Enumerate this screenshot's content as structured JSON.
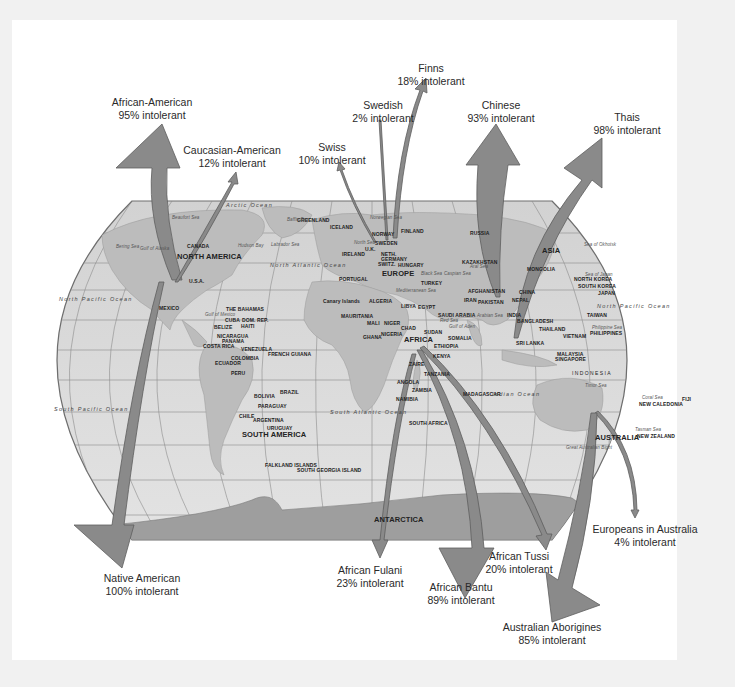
{
  "colors": {
    "background": "#f1f1f1",
    "page": "#ffffff",
    "ocean": "#dcdcdc",
    "land": "#bdbdbd",
    "antarctica": "#9e9e9e",
    "arrow_fill": "#8a8a8a",
    "arrow_stroke": "#5e5e5e",
    "grid": "#8c8c8c"
  },
  "populations": [
    {
      "id": "african-american",
      "name": "African-American",
      "value": "95% intolerant"
    },
    {
      "id": "caucasian-american",
      "name": "Caucasian-American",
      "value": "12% intolerant"
    },
    {
      "id": "swiss",
      "name": "Swiss",
      "value": "10% intolerant"
    },
    {
      "id": "swedish",
      "name": "Swedish",
      "value": "2% intolerant"
    },
    {
      "id": "finns",
      "name": "Finns",
      "value": "18% intolerant"
    },
    {
      "id": "chinese",
      "name": "Chinese",
      "value": "93% intolerant"
    },
    {
      "id": "thais",
      "name": "Thais",
      "value": "98% intolerant"
    },
    {
      "id": "native-american",
      "name": "Native American",
      "value": "100% intolerant"
    },
    {
      "id": "african-fulani",
      "name": "African Fulani",
      "value": "23% intolerant"
    },
    {
      "id": "african-bantu",
      "name": "African Bantu",
      "value": "89% intolerant"
    },
    {
      "id": "african-tussi",
      "name": "African Tussi",
      "value": "20% intolerant"
    },
    {
      "id": "europeans-australia",
      "name": "Europeans in Australia",
      "value": "4% intolerant"
    },
    {
      "id": "australian-aborigines",
      "name": "Australian Aborigines",
      "value": "85% intolerant"
    }
  ],
  "map": {
    "continents": [
      "NORTH AMERICA",
      "SOUTH AMERICA",
      "EUROPE",
      "AFRICA",
      "ASIA",
      "AUSTRALIA",
      "ANTARCTICA"
    ],
    "oceans": [
      "Arctic Ocean",
      "North Pacific Ocean",
      "North Atlantic Ocean",
      "South Pacific Ocean",
      "South Atlantic Ocean",
      "Indian Ocean",
      "North Pacific Ocean"
    ],
    "places": [
      "CANADA",
      "U.S.A.",
      "MEXICO",
      "THE BAHAMAS",
      "CUBA",
      "DOM. REP.",
      "HAITI",
      "BELIZE",
      "NICARAGUA",
      "PANAMA",
      "COSTA RICA",
      "VENEZUELA",
      "COLOMBIA",
      "FRENCH GUIANA",
      "ECUADOR",
      "PERU",
      "BRAZIL",
      "BOLIVIA",
      "PARAGUAY",
      "CHILE",
      "ARGENTINA",
      "URUGUAY",
      "FALKLAND ISLANDS",
      "SOUTH GEORGIA ISLAND",
      "GREENLAND",
      "ICELAND",
      "NORWAY",
      "SWEDEN",
      "FINLAND",
      "IRELAND",
      "U.K.",
      "NETH.",
      "GERMANY",
      "SWITZ.",
      "HUNGARY",
      "PORTUGAL",
      "RUSSIA",
      "KAZAKHSTAN",
      "TURKEY",
      "Canary Islands",
      "ALGERIA",
      "LIBYA",
      "EGYPT",
      "MAURITANIA",
      "MALI",
      "NIGER",
      "CHAD",
      "SUDAN",
      "GHANA",
      "NIGERIA",
      "ETHIOPIA",
      "SOMALIA",
      "KENYA",
      "ZAIRE",
      "TANZANIA",
      "ANGOLA",
      "ZAMBIA",
      "NAMIBIA",
      "SOUTH AFRICA",
      "MADAGASCAR",
      "SAUDI ARABIA",
      "IRAN",
      "AFGHANISTAN",
      "PAKISTAN",
      "INDIA",
      "NEPAL",
      "CHINA",
      "MONGOLIA",
      "BANGLADESH",
      "SRI LANKA",
      "THAILAND",
      "VIETNAM",
      "MALAYSIA",
      "SINGAPORE",
      "INDONESIA",
      "PHILIPPINES",
      "TAIWAN",
      "NORTH KOREA",
      "SOUTH KOREA",
      "JAPAN",
      "NEW CALEDONIA",
      "FIJI",
      "NEW ZEALAND"
    ],
    "seas": [
      "Beaufort Sea",
      "Baffin Bay",
      "Bering Sea",
      "Gulf of Alaska",
      "Hudson Bay",
      "Labrador Sea",
      "Gulf of Mexico",
      "North Sea",
      "Norwegian Sea",
      "Black Sea",
      "Caspian Sea",
      "Aral Sea",
      "Mediterranean Sea",
      "Red Sea",
      "Gulf of Aden",
      "Arabian Sea",
      "Sea of Okhotsk",
      "Sea of Japan",
      "Philippine Sea",
      "Timor Sea",
      "Coral Sea",
      "Tasman Sea",
      "Great Australian Bight"
    ]
  }
}
